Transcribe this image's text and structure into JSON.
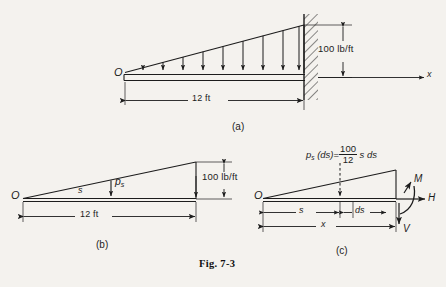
{
  "figure": {
    "caption": "Fig. 7-3",
    "background_color": "#f4f2ee",
    "ink_color": "#1c1c1c"
  },
  "panels": [
    {
      "id": "a",
      "caption": "(a)",
      "origin_label": "O",
      "axis_label": "x",
      "span_label": "12 ft",
      "intensity_label": "100 lb/ft",
      "load_arrow_count": 9,
      "support": "fixed-wall-hatched-right",
      "description": "Cantilever beam fixed at right wall with linearly increasing distributed load"
    },
    {
      "id": "b",
      "caption": "(b)",
      "origin_label": "O",
      "distance_label": "s",
      "intensity_symbol": "p",
      "intensity_subscript": "s",
      "span_label": "12 ft",
      "intensity_label": "100 lb/ft",
      "description": "Load intensity triangle showing p sub s at distance s from O"
    },
    {
      "id": "c",
      "caption": "(c)",
      "origin_label": "O",
      "equation": {
        "lhs_symbol": "p",
        "lhs_subscript": "s",
        "lhs_paren": "(ds)",
        "equals": "=",
        "numerator": "100",
        "denominator": "12",
        "rhs_tail": "s ds"
      },
      "distance_label": "s",
      "element_label": "ds",
      "total_label": "x",
      "reactions": [
        {
          "symbol": "M",
          "kind": "moment-arrow"
        },
        {
          "symbol": "H",
          "kind": "horizontal-force-arrow"
        },
        {
          "symbol": "V",
          "kind": "vertical-force-arrow"
        }
      ],
      "description": "Free-body diagram of beam segment with differential load element and internal reactions M, H, V"
    }
  ]
}
